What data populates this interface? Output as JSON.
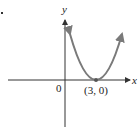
{
  "figure": {
    "axes": {
      "x_label": "x",
      "y_label": "y",
      "origin_label": "0"
    },
    "vertex_label": "(3, 0)",
    "curve": {
      "type": "parabola",
      "equation_implied": "y = a(x - 3)^2",
      "vertex": [
        3,
        0
      ],
      "opens": "up"
    },
    "colors": {
      "axis": "#333333",
      "curve": "#7a7a7a",
      "text": "#222222"
    }
  }
}
